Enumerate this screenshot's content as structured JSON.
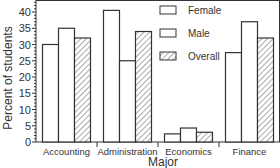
{
  "chart_data": {
    "type": "bar",
    "title": "",
    "xlabel": "Major",
    "ylabel": "Percent of students",
    "ylim": [
      0,
      43
    ],
    "yticks": [
      0,
      5,
      10,
      15,
      20,
      25,
      30,
      35,
      40
    ],
    "categories": [
      "Accounting",
      "Administration",
      "Economics",
      "Finance"
    ],
    "series": [
      {
        "name": "Female",
        "pattern": "plain",
        "values": [
          30,
          40.5,
          2.5,
          27.5
        ]
      },
      {
        "name": "Male",
        "pattern": "plain",
        "values": [
          35,
          25,
          4.3,
          37
        ]
      },
      {
        "name": "Overall",
        "pattern": "hatched",
        "values": [
          32,
          34,
          3,
          32
        ]
      }
    ],
    "legend": {
      "position": "top-right",
      "entries": [
        "Female",
        "Male",
        "Overall"
      ]
    },
    "grid": false
  }
}
